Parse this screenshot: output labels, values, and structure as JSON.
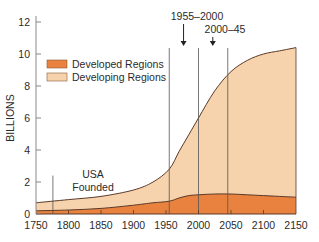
{
  "chart_data": {
    "type": "area",
    "title": "",
    "xlabel": "",
    "ylabel": "BILLIONS",
    "xlim": [
      1750,
      2150
    ],
    "ylim": [
      0,
      12
    ],
    "xticks": [
      1750,
      1800,
      1850,
      1900,
      1950,
      2000,
      2050,
      2100,
      2150
    ],
    "yticks": [
      0,
      2,
      4,
      6,
      8,
      10,
      12
    ],
    "grid": false,
    "legend_position": "top-left",
    "colors": {
      "developed": "#e8823e",
      "developing": "#f6d3ad",
      "line": "#5a3a2a",
      "axis": "#888888"
    },
    "series": [
      {
        "name": "Developed Regions",
        "x": [
          1750,
          1800,
          1850,
          1900,
          1930,
          1955,
          1970,
          1985,
          2000,
          2025,
          2050,
          2075,
          2100,
          2125,
          2150
        ],
        "values": [
          0.2,
          0.25,
          0.35,
          0.55,
          0.7,
          0.8,
          1.0,
          1.15,
          1.2,
          1.25,
          1.25,
          1.2,
          1.15,
          1.1,
          1.05
        ]
      },
      {
        "name": "Developing Regions",
        "x": [
          1750,
          1800,
          1850,
          1900,
          1930,
          1955,
          1970,
          1985,
          2000,
          2025,
          2050,
          2075,
          2100,
          2125,
          2150
        ],
        "values": [
          0.5,
          0.65,
          0.75,
          0.95,
          1.3,
          2.0,
          2.9,
          3.8,
          4.8,
          6.45,
          7.65,
          8.4,
          8.85,
          9.1,
          9.35
        ]
      }
    ],
    "total": {
      "x": [
        1750,
        1800,
        1850,
        1900,
        1930,
        1955,
        1970,
        1985,
        2000,
        2025,
        2050,
        2075,
        2100,
        2125,
        2150
      ],
      "values": [
        0.7,
        0.9,
        1.1,
        1.5,
        2.0,
        2.8,
        3.9,
        4.95,
        6.0,
        7.7,
        8.9,
        9.6,
        10.0,
        10.2,
        10.4
      ]
    },
    "reference_lines": [
      1776,
      1955,
      2000,
      2045
    ],
    "annotations": [
      {
        "text": "USA",
        "line2": "Founded",
        "x": 1810,
        "y": 1.6
      },
      {
        "text": "1955–2000",
        "arrow_x": 1977
      },
      {
        "text": "2000–45",
        "arrow_x": 2022
      }
    ]
  }
}
